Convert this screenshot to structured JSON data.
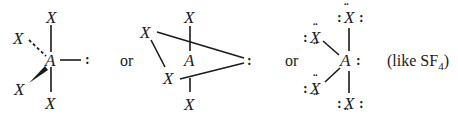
{
  "atoms": {
    "ligand": "X",
    "central": "A"
  },
  "lone_pair": ":",
  "lone_pair_top": "¨",
  "connector_word": "or",
  "annotation": {
    "prefix": "(like SF",
    "subscript": "4",
    "suffix": ")"
  },
  "structures": [
    {
      "name": "wedge-dash-representation",
      "ligands": 4,
      "lone_pairs_on_central": 1
    },
    {
      "name": "seesaw-perspective-representation",
      "ligands": 4,
      "lone_pairs_on_central": 1
    },
    {
      "name": "lewis-dot-representation",
      "ligands": 4,
      "lone_pairs_on_central": 1
    }
  ],
  "colors": {
    "ink": "#1a1a1a",
    "background": "#ffffff"
  }
}
